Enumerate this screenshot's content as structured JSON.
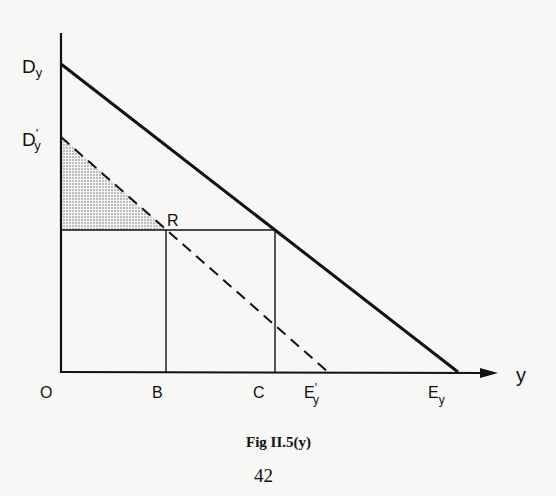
{
  "figure": {
    "caption": "Fig II.5(y)",
    "page_number": "42"
  },
  "axes": {
    "origin_label": "O",
    "x_axis_label": "y"
  },
  "labels": {
    "Dy": {
      "main": "D",
      "sub": "y",
      "prime": ""
    },
    "Dy_prime": {
      "main": "D",
      "sub": "y",
      "prime": "'"
    },
    "R": "R",
    "B": "B",
    "C": "C",
    "Ey_prime": {
      "main": "E",
      "sub": "y",
      "prime": "'"
    },
    "Ey": {
      "main": "E",
      "sub": "y",
      "prime": ""
    }
  },
  "lines": {
    "demand_curve": {
      "from": "Dy",
      "to": "Ey",
      "style": "solid-thick"
    },
    "shifted_demand_curve": {
      "from": "D'y",
      "to": "E'y",
      "style": "dashed"
    },
    "horizontal_price_line": {
      "from": "axis",
      "through": "R",
      "to": "C-vertical",
      "style": "solid-thin"
    },
    "vertical_B": {
      "from": "R",
      "to": "B",
      "style": "solid-thin"
    },
    "vertical_C": {
      "from": "demand-curve",
      "to": "C",
      "style": "solid-thin"
    }
  },
  "shaded_region": {
    "vertices": [
      "D'y",
      "R",
      "axis-at-price"
    ],
    "pattern": "stippled"
  }
}
